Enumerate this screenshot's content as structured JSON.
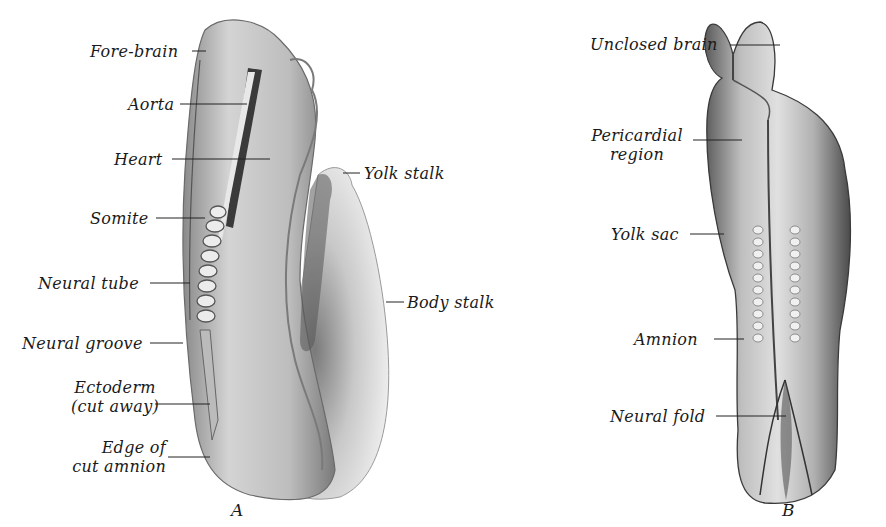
{
  "figure": {
    "panels": [
      {
        "id": "A",
        "caption": "A",
        "labels": [
          {
            "key": "fore_brain",
            "text": "Fore-brain"
          },
          {
            "key": "aorta",
            "text": "Aorta"
          },
          {
            "key": "heart",
            "text": "Heart"
          },
          {
            "key": "somite",
            "text": "Somite"
          },
          {
            "key": "neural_tube",
            "text": "Neural tube"
          },
          {
            "key": "neural_groove",
            "text": "Neural groove"
          },
          {
            "key": "ectoderm",
            "text": "Ectoderm",
            "line2": "(cut away)"
          },
          {
            "key": "edge_of_cut_amnion",
            "text": "Edge of",
            "line2": "cut amnion"
          },
          {
            "key": "yolk_stalk",
            "text": "Yolk stalk"
          },
          {
            "key": "body_stalk",
            "text": "Body stalk"
          }
        ]
      },
      {
        "id": "B",
        "caption": "B",
        "labels": [
          {
            "key": "unclosed_brain",
            "text": "Unclosed brain"
          },
          {
            "key": "pericardial_region",
            "text": "Pericardial",
            "line2": "region"
          },
          {
            "key": "yolk_sac",
            "text": "Yolk sac"
          },
          {
            "key": "amnion",
            "text": "Amnion"
          },
          {
            "key": "neural_fold",
            "text": "Neural fold"
          }
        ]
      }
    ]
  }
}
